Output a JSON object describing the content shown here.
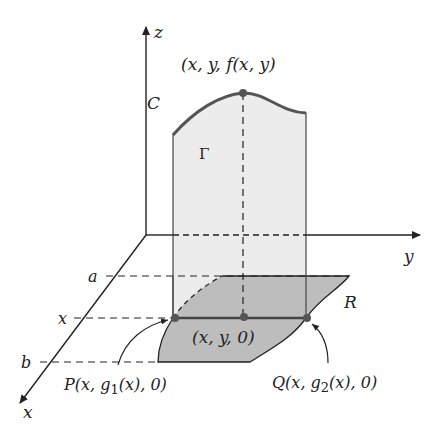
{
  "diagram": {
    "axes": {
      "z_label": "z",
      "y_label": "y",
      "x_label": "x"
    },
    "x_axis_ticks": {
      "a": "a",
      "x": "x",
      "b": "b"
    },
    "labels": {
      "top_point": "(x, y, f(x, y)",
      "curve": "C",
      "surface_slice": "Γ",
      "region": "R",
      "mid_point": "(x, y, 0)",
      "P_point": "P(x, g",
      "P_sub": "1",
      "P_tail": "(x), 0)",
      "Q_point": "Q(x, g",
      "Q_sub": "2",
      "Q_tail": "(x), 0)"
    },
    "colors": {
      "slice_fill": "#ececec",
      "region_fill": "#bdbdbd",
      "curve_stroke": "#555555",
      "axis_stroke": "#222222"
    }
  }
}
